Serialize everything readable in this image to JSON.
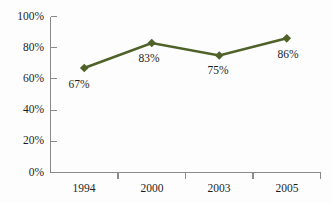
{
  "chart_data": {
    "type": "line",
    "title": "",
    "subtitle": "",
    "xlabel": "",
    "ylabel": "",
    "categories": [
      "1994",
      "2000",
      "2003",
      "2005"
    ],
    "values": [
      67,
      83,
      75,
      86
    ],
    "point_labels": [
      "67%",
      "83%",
      "75%",
      "86%"
    ],
    "series": [
      {
        "name": "",
        "values": [
          67,
          83,
          75,
          86
        ],
        "color": "#4f6228",
        "marker": "diamond"
      }
    ],
    "ylim": [
      0,
      100
    ],
    "yticks": [
      0,
      20,
      40,
      60,
      80,
      100
    ],
    "ytick_labels": [
      "0%",
      "20%",
      "40%",
      "60%",
      "80%",
      "100%"
    ],
    "grid": false,
    "legend": false,
    "legend_position": "none"
  },
  "style": {
    "line_color": "#4f6228",
    "marker_color": "#4f6228",
    "axis_color": "#8a8a8a",
    "text_color": "#1d1d1d",
    "background": "#fdfdfd"
  },
  "axis": {
    "y_labels": [
      "100%",
      "80%",
      "60%",
      "40%",
      "20%",
      "0%"
    ],
    "x_labels": [
      "1994",
      "2000",
      "2003",
      "2005"
    ]
  }
}
